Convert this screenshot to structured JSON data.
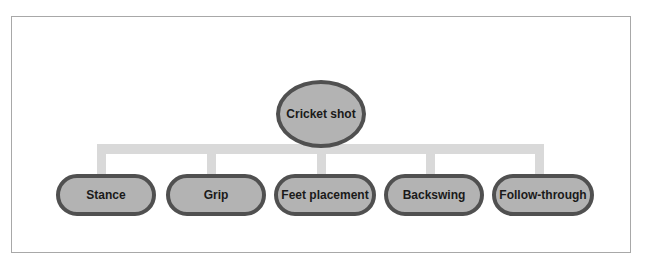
{
  "diagram": {
    "type": "hierarchy",
    "root": {
      "label": "Cricket shot"
    },
    "children": [
      {
        "label": "Stance"
      },
      {
        "label": "Grip"
      },
      {
        "label": "Feet placement"
      },
      {
        "label": "Backswing"
      },
      {
        "label": "Follow-through"
      }
    ]
  },
  "colors": {
    "node_fill": "#b3b3b3",
    "node_border": "#505050",
    "connector": "#d9d9d9",
    "frame_border": "#a8a8a8"
  }
}
